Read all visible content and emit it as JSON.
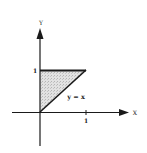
{
  "diagram": {
    "axes": {
      "x_label": "X",
      "y_label": "Y",
      "x_tick": "1",
      "y_tick": "1"
    },
    "curve_label": "y = x",
    "region": {
      "description": "Shaded triangle bounded by x = 0, y = 1, and y = x",
      "vertices": [
        [
          0,
          0
        ],
        [
          0,
          1
        ],
        [
          1,
          1
        ]
      ],
      "fill_color": "#c8c8c8"
    },
    "line_color": "#1a1a1a"
  }
}
